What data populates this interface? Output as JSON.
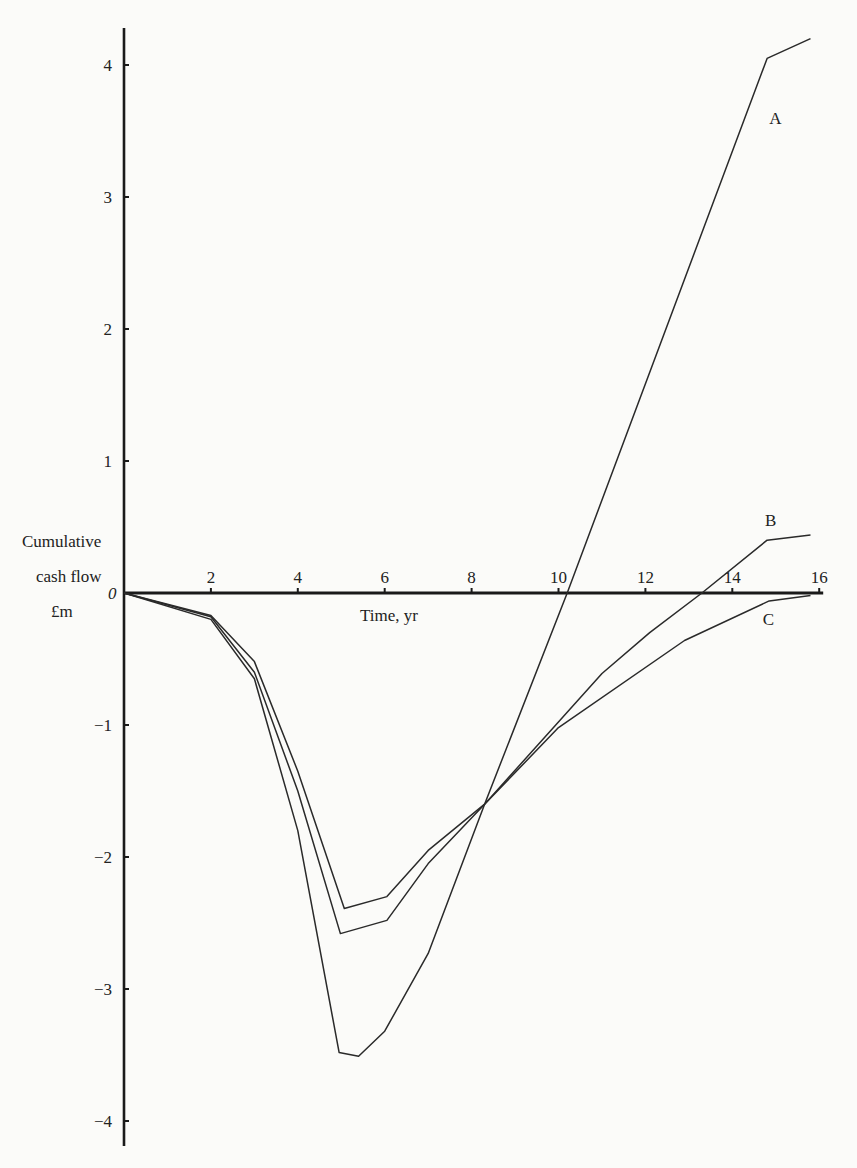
{
  "chart_data": {
    "type": "line",
    "title": "",
    "xlabel": "Time, yr",
    "ylabel": [
      "Cumulative",
      "cash flow",
      "£m"
    ],
    "xlim": [
      0,
      16
    ],
    "ylim": [
      -4.2,
      4.3
    ],
    "x_ticks": [
      2,
      4,
      6,
      8,
      10,
      12,
      14,
      16
    ],
    "y_ticks": [
      4,
      3,
      2,
      1,
      0,
      -1,
      -2,
      -3,
      -4
    ],
    "origin_label": "0",
    "grid": false,
    "legend": "inline labels",
    "series": [
      {
        "name": "A",
        "points": [
          [
            0,
            0
          ],
          [
            2,
            -0.2
          ],
          [
            3,
            -0.65
          ],
          [
            4,
            -1.8
          ],
          [
            4.95,
            -3.48
          ],
          [
            5.4,
            -3.51
          ],
          [
            6.0,
            -3.32
          ],
          [
            7.0,
            -2.73
          ],
          [
            8.3,
            -1.6
          ],
          [
            10.2,
            0.0
          ],
          [
            14.8,
            4.05
          ],
          [
            15.8,
            4.2
          ]
        ]
      },
      {
        "name": "B",
        "points": [
          [
            0,
            0
          ],
          [
            2,
            -0.18
          ],
          [
            3,
            -0.6
          ],
          [
            4,
            -1.5
          ],
          [
            4.98,
            -2.58
          ],
          [
            6.05,
            -2.48
          ],
          [
            7.0,
            -2.05
          ],
          [
            8.3,
            -1.6
          ],
          [
            11.0,
            -0.61
          ],
          [
            12.1,
            -0.3
          ],
          [
            13.3,
            0.0
          ],
          [
            14.8,
            0.4
          ],
          [
            15.8,
            0.44
          ]
        ]
      },
      {
        "name": "C",
        "points": [
          [
            0,
            0
          ],
          [
            2,
            -0.17
          ],
          [
            3,
            -0.52
          ],
          [
            4,
            -1.35
          ],
          [
            5.07,
            -2.39
          ],
          [
            6.05,
            -2.3
          ],
          [
            7.0,
            -1.95
          ],
          [
            8.3,
            -1.6
          ],
          [
            10.0,
            -1.02
          ],
          [
            12.9,
            -0.36
          ],
          [
            14.85,
            -0.06
          ],
          [
            15.8,
            -0.02
          ]
        ]
      }
    ],
    "series_label_positions": {
      "A": [
        14.85,
        3.6
      ],
      "B": [
        14.75,
        0.55
      ],
      "C": [
        14.7,
        -0.2
      ]
    }
  },
  "labels": {
    "ylabel_line1": "Cumulative",
    "ylabel_line2": "cash flow",
    "ylabel_line3": "£m",
    "xlabel": "Time, yr",
    "origin": "0"
  }
}
